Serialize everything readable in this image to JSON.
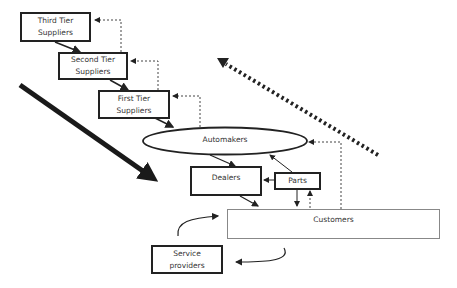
{
  "diagram": {
    "nodes": {
      "third_tier": {
        "label": "Third Tier Suppliers"
      },
      "second_tier": {
        "label": "Second Tier Suppliers"
      },
      "first_tier": {
        "label": "First Tier Suppliers"
      },
      "automakers": {
        "label": "Automakers"
      },
      "dealers": {
        "label": "Dealers"
      },
      "parts": {
        "label": "Parts"
      },
      "customers": {
        "label": "Customers"
      },
      "service_providers": {
        "label": "Service providers"
      }
    },
    "flows": [
      {
        "from": "Third Tier Suppliers",
        "to": "Second Tier Suppliers",
        "style": "solid"
      },
      {
        "from": "Second Tier Suppliers",
        "to": "First Tier Suppliers",
        "style": "solid"
      },
      {
        "from": "First Tier Suppliers",
        "to": "Automakers",
        "style": "solid"
      },
      {
        "from": "Automakers",
        "to": "Dealers",
        "style": "solid"
      },
      {
        "from": "Parts",
        "to": "Automakers",
        "style": "solid"
      },
      {
        "from": "Parts",
        "to": "Dealers",
        "style": "solid"
      },
      {
        "from": "Dealers",
        "to": "Customers",
        "style": "solid"
      },
      {
        "from": "Parts",
        "to": "Customers",
        "style": "solid"
      },
      {
        "from": "Customers",
        "to": "Parts",
        "style": "dashed"
      },
      {
        "from": "Customers",
        "to": "Automakers",
        "style": "dashed"
      },
      {
        "from": "Automakers",
        "to": "First Tier Suppliers",
        "style": "dashed"
      },
      {
        "from": "First Tier Suppliers",
        "to": "Second Tier Suppliers",
        "style": "dashed"
      },
      {
        "from": "Second Tier Suppliers",
        "to": "Third Tier Suppliers",
        "style": "dashed"
      },
      {
        "from": "Service providers",
        "to": "Customers",
        "style": "curved"
      },
      {
        "from": "Customers",
        "to": "Service providers",
        "style": "curved"
      }
    ],
    "big_arrows": [
      {
        "name": "downstream-flow",
        "style": "thick-solid",
        "direction": "down-right"
      },
      {
        "name": "upstream-flow",
        "style": "thick-dotted",
        "direction": "up-left"
      }
    ]
  }
}
